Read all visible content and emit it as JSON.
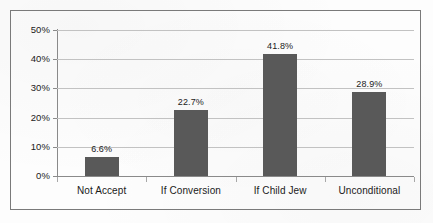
{
  "chart_data": {
    "type": "bar",
    "title": "",
    "subtitle": "",
    "xlabel": "",
    "ylabel": "",
    "categories": [
      "Not Accept",
      "If Conversion",
      "If Child Jew",
      "Unconditional"
    ],
    "values": [
      6.6,
      22.7,
      41.8,
      28.9
    ],
    "value_labels": [
      "6.6%",
      "22.7%",
      "41.8%",
      "28.9%"
    ],
    "ylim": [
      0,
      50
    ],
    "ytick_values": [
      0,
      10,
      20,
      30,
      40,
      50
    ],
    "ytick_labels": [
      "0%",
      "10%",
      "20%",
      "30%",
      "40%",
      "50%"
    ],
    "grid": true,
    "legend": false,
    "legend_position": "none",
    "series": [
      {
        "name": "",
        "values": [
          6.6,
          22.7,
          41.8,
          28.9
        ]
      }
    ],
    "colors": {
      "bar": "#595959",
      "gridline": "#c2c2c2",
      "axis": "#8a8a8a",
      "frame": "#7a7a7a",
      "background": "#fdfdfd",
      "text": "#1a1a1a"
    }
  }
}
